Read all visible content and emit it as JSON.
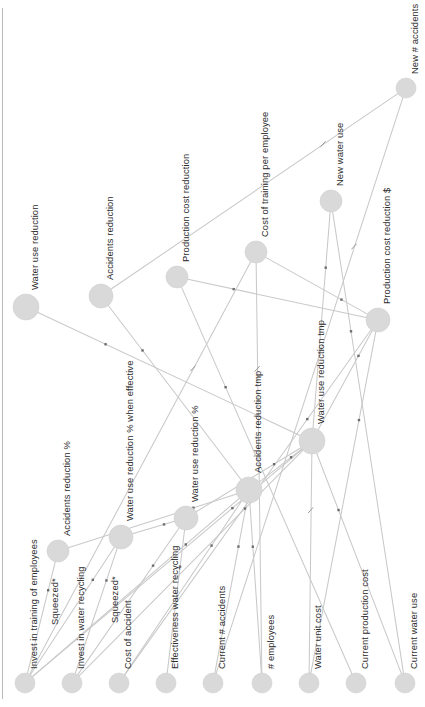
{
  "diagram": {
    "type": "causal-loop-diagram",
    "orientation": "rotated-90",
    "background_color": "#ffffff",
    "node_color": "#d9d9d9",
    "edge_color": "#c9c9c9",
    "label_color": "#2b2b2b",
    "frame": {
      "left_rule_x": 2
    }
  },
  "nodes": [
    {
      "id": "water-use-reduction",
      "label": "Water use reduction",
      "x": 26,
      "y": 307,
      "r": 13
    },
    {
      "id": "accidents-reduction",
      "label": "Accidents reduction",
      "x": 101,
      "y": 296,
      "r": 12
    },
    {
      "id": "production-cost-reduction",
      "label": "Production cost reduction",
      "x": 177,
      "y": 277,
      "r": 11
    },
    {
      "id": "cost-of-training-per-employee",
      "label": "Cost of training per employee",
      "x": 256,
      "y": 252,
      "r": 11
    },
    {
      "id": "new-water-use",
      "label": "New water use",
      "x": 331,
      "y": 201,
      "r": 11
    },
    {
      "id": "new-number-accidents",
      "label": "New # accidents",
      "x": 406,
      "y": 88,
      "r": 10
    },
    {
      "id": "production-cost-reduction-dollar",
      "label": "Production cost reduction $",
      "x": 378,
      "y": 320,
      "r": 12
    },
    {
      "id": "accidents-reduction-pct",
      "label": "Accidents reduction %",
      "x": 58,
      "y": 551,
      "r": 11
    },
    {
      "id": "water-use-reduction-pct-when-effective",
      "label": "Water use reduction % when effective",
      "x": 121,
      "y": 537,
      "r": 12
    },
    {
      "id": "water-use-reduction-pct",
      "label": "Water use reduction %",
      "x": 186,
      "y": 518,
      "r": 12
    },
    {
      "id": "accidents-reduction-tmp",
      "label": "Accidents reduction tmp",
      "x": 249,
      "y": 490,
      "r": 13
    },
    {
      "id": "water-use-reduction-tmp",
      "label": "Water use reduction tmp",
      "x": 312,
      "y": 441,
      "r": 13
    },
    {
      "id": "invest-in-training-of-employees",
      "label": "Invest in training of employees",
      "x": 25,
      "y": 683,
      "r": 10
    },
    {
      "id": "invest-in-water-recycling",
      "label": "Invest in water recycling",
      "x": 72,
      "y": 683,
      "r": 10
    },
    {
      "id": "cost-of-accident",
      "label": "Cost of accident",
      "x": 119,
      "y": 683,
      "r": 10
    },
    {
      "id": "effectiveness-water-recycling",
      "label": "Effectiveness water recycling",
      "x": 166,
      "y": 683,
      "r": 10
    },
    {
      "id": "current-number-accidents",
      "label": "Current # accidents",
      "x": 213,
      "y": 683,
      "r": 10
    },
    {
      "id": "number-employees",
      "label": "# employees",
      "x": 262,
      "y": 683,
      "r": 10
    },
    {
      "id": "water-unit-cost",
      "label": "Water unit cost",
      "x": 309,
      "y": 683,
      "r": 10
    },
    {
      "id": "current-production-cost",
      "label": "Current production cost",
      "x": 356,
      "y": 683,
      "r": 10
    },
    {
      "id": "current-water-use",
      "label": "Current water use",
      "x": 405,
      "y": 683,
      "r": 10
    }
  ],
  "annotation_labels": [
    {
      "id": "squeezed-training",
      "label": "Squeezed*",
      "x": 50,
      "y": 625
    },
    {
      "id": "squeezed-recycling",
      "label": "Squeezed*",
      "x": 110,
      "y": 623
    }
  ],
  "edges": [
    {
      "from": "invest-in-training-of-employees",
      "to": "accidents-reduction-pct",
      "mark": "asterisk"
    },
    {
      "from": "invest-in-training-of-employees",
      "to": "water-use-reduction-pct-when-effective",
      "mark": "asterisk"
    },
    {
      "from": "invest-in-training-of-employees",
      "to": "accidents-reduction-tmp",
      "mark": "asterisk"
    },
    {
      "from": "invest-in-training-of-employees",
      "to": "water-use-reduction-tmp",
      "mark": "asterisk"
    },
    {
      "from": "invest-in-training-of-employees",
      "to": "cost-of-training-per-employee",
      "mark": "tick"
    },
    {
      "from": "invest-in-water-recycling",
      "to": "water-use-reduction-pct-when-effective",
      "mark": "asterisk"
    },
    {
      "from": "invest-in-water-recycling",
      "to": "water-use-reduction-pct",
      "mark": "asterisk"
    },
    {
      "from": "invest-in-water-recycling",
      "to": "water-use-reduction-tmp",
      "mark": "asterisk"
    },
    {
      "from": "cost-of-accident",
      "to": "accidents-reduction-tmp",
      "mark": "asterisk"
    },
    {
      "from": "cost-of-accident",
      "to": "production-cost-reduction-dollar",
      "mark": "asterisk"
    },
    {
      "from": "effectiveness-water-recycling",
      "to": "water-use-reduction-pct",
      "mark": "asterisk"
    },
    {
      "from": "current-number-accidents",
      "to": "accidents-reduction-tmp",
      "mark": "asterisk"
    },
    {
      "from": "current-number-accidents",
      "to": "new-number-accidents",
      "mark": "tick"
    },
    {
      "from": "number-employees",
      "to": "cost-of-training-per-employee",
      "mark": "tick"
    },
    {
      "from": "number-employees",
      "to": "accidents-reduction-tmp",
      "mark": "asterisk"
    },
    {
      "from": "water-unit-cost",
      "to": "production-cost-reduction-dollar",
      "mark": "asterisk"
    },
    {
      "from": "water-unit-cost",
      "to": "water-use-reduction-tmp",
      "mark": "tick"
    },
    {
      "from": "current-production-cost",
      "to": "production-cost-reduction",
      "mark": "asterisk"
    },
    {
      "from": "current-water-use",
      "to": "water-use-reduction-tmp",
      "mark": "asterisk"
    },
    {
      "from": "current-water-use",
      "to": "new-water-use",
      "mark": "asterisk"
    },
    {
      "from": "accidents-reduction-pct",
      "to": "accidents-reduction-tmp",
      "mark": "asterisk"
    },
    {
      "from": "water-use-reduction-pct-when-effective",
      "to": "water-use-reduction-pct",
      "mark": "asterisk"
    },
    {
      "from": "water-use-reduction-pct",
      "to": "water-use-reduction-tmp",
      "mark": "asterisk"
    },
    {
      "from": "accidents-reduction-tmp",
      "to": "accidents-reduction",
      "mark": "asterisk"
    },
    {
      "from": "accidents-reduction-tmp",
      "to": "water-use-reduction-tmp",
      "mark": "asterisk"
    },
    {
      "from": "water-use-reduction-tmp",
      "to": "water-use-reduction",
      "mark": "asterisk"
    },
    {
      "from": "water-use-reduction-tmp",
      "to": "new-water-use",
      "mark": "asterisk"
    },
    {
      "from": "water-use-reduction-tmp",
      "to": "production-cost-reduction-dollar",
      "mark": "asterisk"
    },
    {
      "from": "accidents-reduction",
      "to": "new-number-accidents",
      "mark": "tick"
    },
    {
      "from": "production-cost-reduction-dollar",
      "to": "production-cost-reduction",
      "mark": "asterisk"
    },
    {
      "from": "cost-of-training-per-employee",
      "to": "production-cost-reduction-dollar",
      "mark": "asterisk"
    }
  ]
}
